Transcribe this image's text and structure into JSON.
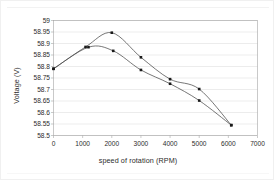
{
  "chart_data": {
    "type": "line",
    "title": "",
    "xlabel": "speed of rotation (RPM)",
    "ylabel": "Voltage (V)",
    "xlim": [
      0,
      7000
    ],
    "ylim": [
      58.5,
      59
    ],
    "xticks": [
      0,
      1000,
      2000,
      3000,
      4000,
      5000,
      6000,
      7000
    ],
    "xtick_labels": [
      "0",
      "1000",
      "2000",
      "3000",
      "4000",
      "5000",
      "6000",
      "7000"
    ],
    "yticks": [
      58.5,
      58.55,
      58.6,
      58.65,
      58.7,
      58.75,
      58.8,
      58.85,
      58.9,
      58.95,
      59
    ],
    "ytick_labels": [
      "58.5",
      "58.55",
      "58.6",
      "58.65",
      "58.7",
      "58.75",
      "58.8",
      "58.85",
      "58.9",
      "58.95",
      "59"
    ],
    "grid": {
      "horizontal": true,
      "vertical": false
    },
    "legend": {
      "visible": false,
      "position": "none"
    },
    "line_color": "#4a4a4a",
    "marker_color": "#1a1a1a",
    "grid_color": "#d9d9d9",
    "axis_color": "#a6a6a6",
    "series": [
      {
        "name": "series-1",
        "x": [
          0,
          1100,
          2000,
          3000,
          4000,
          5000,
          6100
        ],
        "values": [
          58.79,
          58.885,
          58.947,
          58.84,
          58.745,
          58.702,
          58.545
        ]
      },
      {
        "name": "series-2",
        "x": [
          0,
          1200,
          2050,
          3000,
          4000,
          5000,
          6100
        ],
        "values": [
          58.79,
          58.884,
          58.868,
          58.785,
          58.725,
          58.652,
          58.545
        ]
      }
    ]
  }
}
